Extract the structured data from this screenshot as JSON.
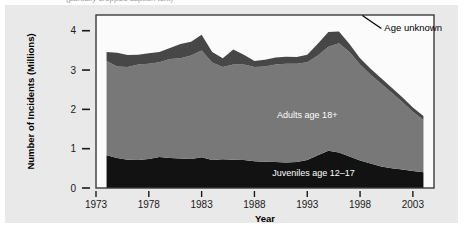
{
  "page": {
    "background_color": "#e9e9e9",
    "card_color": "#e9e9e9",
    "cropped_caption": "(partially cropped caption text)"
  },
  "chart_data": {
    "type": "area",
    "stacked": true,
    "title": "",
    "subtitle": "",
    "xlabel": "Year",
    "ylabel": "Number of Incidents (Millions)",
    "xlim": [
      1973,
      2005
    ],
    "ylim": [
      0,
      4.4
    ],
    "grid": false,
    "legend_position": "inline-annotations",
    "x_ticks": [
      1973,
      1978,
      1983,
      1988,
      1993,
      1998,
      2003
    ],
    "x_tick_labels": [
      "1973",
      "1978",
      "1983",
      "1988",
      "1993",
      "1998",
      "2003"
    ],
    "y_ticks": [
      0,
      1,
      2,
      3,
      4
    ],
    "y_tick_labels": [
      "0",
      "1",
      "2",
      "3",
      "4"
    ],
    "x": [
      1974,
      1975,
      1976,
      1977,
      1978,
      1979,
      1980,
      1981,
      1982,
      1983,
      1984,
      1985,
      1986,
      1987,
      1988,
      1989,
      1990,
      1991,
      1992,
      1993,
      1994,
      1995,
      1996,
      1997,
      1998,
      1999,
      2000,
      2001,
      2002,
      2003,
      2004
    ],
    "series": [
      {
        "name": "Juveniles age 12-17",
        "label": "Juveniles age 12–17",
        "color": "#121212",
        "values": [
          0.83,
          0.76,
          0.72,
          0.71,
          0.74,
          0.79,
          0.76,
          0.75,
          0.74,
          0.78,
          0.71,
          0.73,
          0.72,
          0.71,
          0.68,
          0.67,
          0.66,
          0.65,
          0.66,
          0.71,
          0.83,
          0.95,
          0.9,
          0.8,
          0.7,
          0.62,
          0.55,
          0.5,
          0.47,
          0.43,
          0.4
        ]
      },
      {
        "name": "Adults age 18+",
        "label": "Adults age 18+",
        "color": "#787878",
        "values": [
          2.4,
          2.33,
          2.36,
          2.43,
          2.42,
          2.41,
          2.52,
          2.55,
          2.63,
          2.72,
          2.48,
          2.35,
          2.42,
          2.43,
          2.4,
          2.42,
          2.48,
          2.51,
          2.5,
          2.49,
          2.54,
          2.64,
          2.78,
          2.66,
          2.44,
          2.26,
          2.1,
          1.92,
          1.72,
          1.51,
          1.33
        ]
      },
      {
        "name": "Age unknown",
        "label": "Age unknown",
        "color": "#474747",
        "values": [
          0.23,
          0.35,
          0.3,
          0.25,
          0.27,
          0.26,
          0.28,
          0.36,
          0.35,
          0.4,
          0.27,
          0.22,
          0.38,
          0.25,
          0.15,
          0.17,
          0.18,
          0.18,
          0.17,
          0.19,
          0.3,
          0.38,
          0.3,
          0.2,
          0.16,
          0.15,
          0.14,
          0.13,
          0.12,
          0.11,
          0.1
        ]
      }
    ],
    "annotations": [
      {
        "text": "Age unknown",
        "x": 2000.3,
        "y": 4.08,
        "anchor": "start",
        "style": "dark",
        "leader_line": true
      },
      {
        "text": "Adults age 18+",
        "x": 1993.0,
        "y": 1.85,
        "anchor": "middle",
        "style": "light",
        "leader_line": false
      },
      {
        "text": "Juveniles age 12–17",
        "x": 1993.6,
        "y": 0.38,
        "anchor": "middle",
        "style": "light",
        "leader_line": false
      }
    ]
  }
}
